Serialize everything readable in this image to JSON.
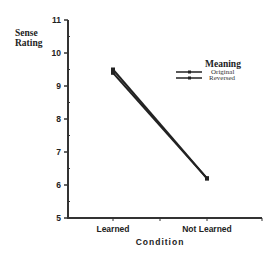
{
  "chart_data": {
    "type": "line",
    "title": "",
    "xlabel": "Condition",
    "ylabel": "Sense Rating",
    "ylabel_lines": [
      "Sense",
      "Rating"
    ],
    "categories": [
      "Learned",
      "Not Learned"
    ],
    "series": [
      {
        "name": "Original",
        "values": [
          9.5,
          6.2
        ]
      },
      {
        "name": "Reversed",
        "values": [
          9.4,
          6.2
        ]
      }
    ],
    "ylim": [
      5,
      11
    ],
    "yticks": [
      5,
      6,
      7,
      8,
      9,
      10,
      11
    ],
    "grid": false,
    "legend": {
      "title": "Meaning",
      "position": "upper right",
      "entries": [
        "Original",
        "Reversed"
      ]
    }
  },
  "colors": {
    "axis": "#333333",
    "line": "#222222",
    "text": "#222222"
  }
}
